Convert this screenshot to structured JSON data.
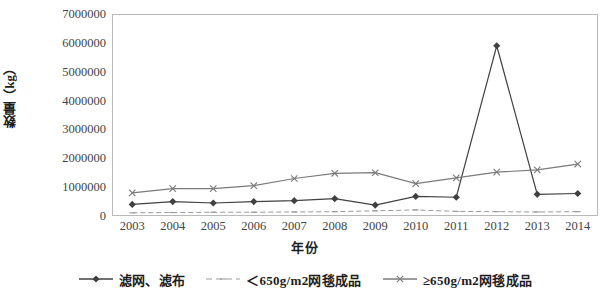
{
  "chart_data": {
    "type": "line",
    "title": "",
    "xlabel": "年份",
    "ylabel": "数量（kg）",
    "categories": [
      "2003",
      "2004",
      "2005",
      "2006",
      "2007",
      "2008",
      "2009",
      "2010",
      "2011",
      "2012",
      "2013",
      "2014"
    ],
    "ylim": [
      0,
      7000000
    ],
    "xlim_labels": [
      "2003",
      "2014"
    ],
    "y_ticks": [
      "0",
      "1000000",
      "2000000",
      "3000000",
      "4000000",
      "5000000",
      "6000000",
      "7000000"
    ],
    "y_tick_values": [
      0,
      1000000,
      2000000,
      3000000,
      4000000,
      5000000,
      6000000,
      7000000
    ],
    "grid": false,
    "legend_position": "bottom",
    "series": [
      {
        "name": "滤网、滤布",
        "marker": "filled-diamond",
        "line_style": "solid",
        "color": "#404040",
        "values": [
          400000,
          500000,
          450000,
          500000,
          530000,
          600000,
          380000,
          680000,
          650000,
          5900000,
          750000,
          780000
        ]
      },
      {
        "name": "＜650g/m2网毯成品",
        "marker": "dash",
        "line_style": "dashed",
        "color": "#9a9a9a",
        "values": [
          110000,
          120000,
          130000,
          130000,
          140000,
          150000,
          180000,
          210000,
          160000,
          150000,
          140000,
          150000
        ]
      },
      {
        "name": "≥650g/m2网毯成品",
        "marker": "cross",
        "line_style": "solid",
        "color": "#7a7a7a",
        "values": [
          800000,
          950000,
          950000,
          1050000,
          1300000,
          1480000,
          1500000,
          1120000,
          1320000,
          1520000,
          1600000,
          1800000
        ]
      }
    ]
  },
  "legend": {
    "items": [
      {
        "label": "滤网、滤布"
      },
      {
        "label": "＜650g/m2网毯成品"
      },
      {
        "label": "≥650g/m2网毯成品"
      }
    ]
  }
}
